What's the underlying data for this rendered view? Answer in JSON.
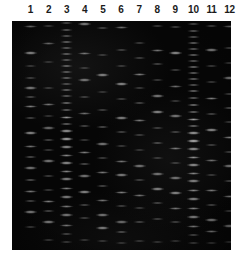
{
  "figure": {
    "kind": "agarose-gel-electrophoresis-photograph",
    "background_color": "#ffffff",
    "gel_color": "#050505",
    "band_color": "#e8e8e8",
    "lane_count": 12
  },
  "lane_labels": [
    "1",
    "2",
    "3",
    "4",
    "5",
    "6",
    "7",
    "8",
    "9",
    "10",
    "11",
    "12"
  ],
  "gel": {
    "left": 12,
    "top": 21,
    "width": 219,
    "height": 229,
    "lane_first_center": 18.5,
    "lane_spacing": 18.1,
    "lane_band_width": 15
  },
  "lanes": [
    {
      "lane": 1,
      "bands": [
        {
          "y": 26,
          "intensity": 0.46,
          "h": 3.0
        },
        {
          "y": 53,
          "intensity": 0.62,
          "h": 3.4
        },
        {
          "y": 66,
          "intensity": 0.3,
          "h": 2.6
        },
        {
          "y": 78,
          "intensity": 0.34,
          "h": 2.6
        },
        {
          "y": 88,
          "intensity": 0.52,
          "h": 3.2
        },
        {
          "y": 97,
          "intensity": 0.38,
          "h": 2.8
        },
        {
          "y": 106,
          "intensity": 0.48,
          "h": 3.0
        },
        {
          "y": 118,
          "intensity": 0.36,
          "h": 2.6
        },
        {
          "y": 133,
          "intensity": 0.58,
          "h": 3.4
        },
        {
          "y": 146,
          "intensity": 0.44,
          "h": 3.0
        },
        {
          "y": 157,
          "intensity": 0.4,
          "h": 2.8
        },
        {
          "y": 168,
          "intensity": 0.5,
          "h": 3.2
        },
        {
          "y": 180,
          "intensity": 0.42,
          "h": 2.8
        },
        {
          "y": 191,
          "intensity": 0.46,
          "h": 3.0
        },
        {
          "y": 201,
          "intensity": 0.38,
          "h": 2.8
        },
        {
          "y": 212,
          "intensity": 0.56,
          "h": 3.4
        },
        {
          "y": 227,
          "intensity": 0.34,
          "h": 2.6
        }
      ]
    },
    {
      "lane": 2,
      "bands": [
        {
          "y": 26,
          "intensity": 0.34,
          "h": 2.8
        },
        {
          "y": 43,
          "intensity": 0.4,
          "h": 3.0
        },
        {
          "y": 62,
          "intensity": 0.26,
          "h": 2.4
        },
        {
          "y": 88,
          "intensity": 0.3,
          "h": 2.6
        },
        {
          "y": 104,
          "intensity": 0.44,
          "h": 3.0
        },
        {
          "y": 116,
          "intensity": 0.28,
          "h": 2.4
        },
        {
          "y": 128,
          "intensity": 0.46,
          "h": 3.2
        },
        {
          "y": 140,
          "intensity": 0.38,
          "h": 2.8
        },
        {
          "y": 150,
          "intensity": 0.3,
          "h": 2.6
        },
        {
          "y": 161,
          "intensity": 0.52,
          "h": 3.2
        },
        {
          "y": 176,
          "intensity": 0.34,
          "h": 2.6
        },
        {
          "y": 190,
          "intensity": 0.3,
          "h": 2.6
        },
        {
          "y": 201,
          "intensity": 0.48,
          "h": 3.0
        },
        {
          "y": 211,
          "intensity": 0.36,
          "h": 2.8
        },
        {
          "y": 222,
          "intensity": 0.54,
          "h": 3.4
        },
        {
          "y": 240,
          "intensity": 0.3,
          "h": 2.6
        }
      ]
    },
    {
      "lane": 3,
      "bands": [
        {
          "y": 23,
          "intensity": 0.4,
          "h": 2.6
        },
        {
          "y": 30,
          "intensity": 0.48,
          "h": 2.6
        },
        {
          "y": 36,
          "intensity": 0.44,
          "h": 2.4
        },
        {
          "y": 42,
          "intensity": 0.52,
          "h": 2.6
        },
        {
          "y": 48,
          "intensity": 0.46,
          "h": 2.4
        },
        {
          "y": 54,
          "intensity": 0.5,
          "h": 2.6
        },
        {
          "y": 60,
          "intensity": 0.44,
          "h": 2.4
        },
        {
          "y": 66,
          "intensity": 0.54,
          "h": 2.6
        },
        {
          "y": 72,
          "intensity": 0.48,
          "h": 2.4
        },
        {
          "y": 78,
          "intensity": 0.5,
          "h": 2.6
        },
        {
          "y": 84,
          "intensity": 0.42,
          "h": 2.4
        },
        {
          "y": 90,
          "intensity": 0.52,
          "h": 2.6
        },
        {
          "y": 96,
          "intensity": 0.46,
          "h": 2.6
        },
        {
          "y": 103,
          "intensity": 0.56,
          "h": 2.8
        },
        {
          "y": 110,
          "intensity": 0.5,
          "h": 2.6
        },
        {
          "y": 117,
          "intensity": 0.58,
          "h": 3.0
        },
        {
          "y": 124,
          "intensity": 0.52,
          "h": 2.8
        },
        {
          "y": 131,
          "intensity": 0.62,
          "h": 3.2
        },
        {
          "y": 139,
          "intensity": 0.7,
          "h": 3.6
        },
        {
          "y": 147,
          "intensity": 0.58,
          "h": 3.2
        },
        {
          "y": 155,
          "intensity": 0.52,
          "h": 3.0
        },
        {
          "y": 163,
          "intensity": 0.6,
          "h": 3.2
        },
        {
          "y": 171,
          "intensity": 0.5,
          "h": 3.0
        },
        {
          "y": 179,
          "intensity": 0.56,
          "h": 3.2
        },
        {
          "y": 188,
          "intensity": 0.48,
          "h": 3.0
        },
        {
          "y": 197,
          "intensity": 0.54,
          "h": 3.2
        },
        {
          "y": 206,
          "intensity": 0.46,
          "h": 3.0
        },
        {
          "y": 215,
          "intensity": 0.52,
          "h": 3.2
        },
        {
          "y": 225,
          "intensity": 0.44,
          "h": 3.0
        },
        {
          "y": 234,
          "intensity": 0.38,
          "h": 2.8
        },
        {
          "y": 242,
          "intensity": 0.3,
          "h": 2.6
        }
      ]
    },
    {
      "lane": 4,
      "bands": [
        {
          "y": 24,
          "intensity": 0.55,
          "h": 3.4
        },
        {
          "y": 53,
          "intensity": 0.44,
          "h": 3.0
        },
        {
          "y": 68,
          "intensity": 0.3,
          "h": 2.6
        },
        {
          "y": 80,
          "intensity": 0.5,
          "h": 3.2
        },
        {
          "y": 97,
          "intensity": 0.34,
          "h": 2.6
        },
        {
          "y": 113,
          "intensity": 0.42,
          "h": 3.0
        },
        {
          "y": 126,
          "intensity": 0.38,
          "h": 2.8
        },
        {
          "y": 140,
          "intensity": 0.3,
          "h": 2.6
        },
        {
          "y": 152,
          "intensity": 0.48,
          "h": 3.0
        },
        {
          "y": 164,
          "intensity": 0.4,
          "h": 2.8
        },
        {
          "y": 176,
          "intensity": 0.52,
          "h": 3.2
        },
        {
          "y": 192,
          "intensity": 0.58,
          "h": 3.4
        },
        {
          "y": 205,
          "intensity": 0.36,
          "h": 2.8
        },
        {
          "y": 218,
          "intensity": 0.32,
          "h": 2.6
        },
        {
          "y": 240,
          "intensity": 0.28,
          "h": 2.4
        }
      ]
    },
    {
      "lane": 5,
      "bands": [
        {
          "y": 28,
          "intensity": 0.36,
          "h": 2.8
        },
        {
          "y": 55,
          "intensity": 0.3,
          "h": 2.6
        },
        {
          "y": 75,
          "intensity": 0.56,
          "h": 3.4
        },
        {
          "y": 92,
          "intensity": 0.28,
          "h": 2.4
        },
        {
          "y": 110,
          "intensity": 0.34,
          "h": 2.6
        },
        {
          "y": 127,
          "intensity": 0.4,
          "h": 2.8
        },
        {
          "y": 144,
          "intensity": 0.52,
          "h": 3.2
        },
        {
          "y": 158,
          "intensity": 0.32,
          "h": 2.6
        },
        {
          "y": 172,
          "intensity": 0.46,
          "h": 3.0
        },
        {
          "y": 186,
          "intensity": 0.38,
          "h": 2.8
        },
        {
          "y": 200,
          "intensity": 0.44,
          "h": 3.0
        },
        {
          "y": 215,
          "intensity": 0.5,
          "h": 3.2
        },
        {
          "y": 228,
          "intensity": 0.54,
          "h": 3.4
        },
        {
          "y": 241,
          "intensity": 0.28,
          "h": 2.4
        }
      ]
    },
    {
      "lane": 6,
      "bands": [
        {
          "y": 27,
          "intensity": 0.42,
          "h": 3.0
        },
        {
          "y": 50,
          "intensity": 0.34,
          "h": 2.6
        },
        {
          "y": 66,
          "intensity": 0.3,
          "h": 2.6
        },
        {
          "y": 84,
          "intensity": 0.58,
          "h": 3.4
        },
        {
          "y": 99,
          "intensity": 0.32,
          "h": 2.6
        },
        {
          "y": 118,
          "intensity": 0.56,
          "h": 3.4
        },
        {
          "y": 132,
          "intensity": 0.36,
          "h": 2.8
        },
        {
          "y": 146,
          "intensity": 0.3,
          "h": 2.6
        },
        {
          "y": 161,
          "intensity": 0.44,
          "h": 3.0
        },
        {
          "y": 175,
          "intensity": 0.54,
          "h": 3.4
        },
        {
          "y": 192,
          "intensity": 0.48,
          "h": 3.0
        },
        {
          "y": 206,
          "intensity": 0.34,
          "h": 2.8
        },
        {
          "y": 222,
          "intensity": 0.46,
          "h": 3.2
        },
        {
          "y": 232,
          "intensity": 0.4,
          "h": 2.8
        },
        {
          "y": 243,
          "intensity": 0.26,
          "h": 2.4
        }
      ]
    },
    {
      "lane": 7,
      "bands": [
        {
          "y": 43,
          "intensity": 0.3,
          "h": 2.6
        },
        {
          "y": 58,
          "intensity": 0.34,
          "h": 2.8
        },
        {
          "y": 74,
          "intensity": 0.48,
          "h": 3.0
        },
        {
          "y": 88,
          "intensity": 0.3,
          "h": 2.6
        },
        {
          "y": 103,
          "intensity": 0.38,
          "h": 2.8
        },
        {
          "y": 120,
          "intensity": 0.46,
          "h": 3.0
        },
        {
          "y": 135,
          "intensity": 0.32,
          "h": 2.6
        },
        {
          "y": 150,
          "intensity": 0.28,
          "h": 2.4
        },
        {
          "y": 166,
          "intensity": 0.5,
          "h": 3.2
        },
        {
          "y": 180,
          "intensity": 0.34,
          "h": 2.8
        },
        {
          "y": 195,
          "intensity": 0.44,
          "h": 3.0
        },
        {
          "y": 208,
          "intensity": 0.3,
          "h": 2.6
        },
        {
          "y": 222,
          "intensity": 0.36,
          "h": 2.8
        },
        {
          "y": 241,
          "intensity": 0.26,
          "h": 2.4
        }
      ]
    },
    {
      "lane": 8,
      "bands": [
        {
          "y": 26,
          "intensity": 0.32,
          "h": 2.6
        },
        {
          "y": 50,
          "intensity": 0.44,
          "h": 3.0
        },
        {
          "y": 64,
          "intensity": 0.36,
          "h": 2.8
        },
        {
          "y": 80,
          "intensity": 0.3,
          "h": 2.6
        },
        {
          "y": 96,
          "intensity": 0.52,
          "h": 3.2
        },
        {
          "y": 112,
          "intensity": 0.58,
          "h": 3.4
        },
        {
          "y": 128,
          "intensity": 0.34,
          "h": 2.8
        },
        {
          "y": 143,
          "intensity": 0.4,
          "h": 2.8
        },
        {
          "y": 158,
          "intensity": 0.3,
          "h": 2.6
        },
        {
          "y": 174,
          "intensity": 0.5,
          "h": 3.2
        },
        {
          "y": 189,
          "intensity": 0.56,
          "h": 3.4
        },
        {
          "y": 203,
          "intensity": 0.36,
          "h": 2.8
        },
        {
          "y": 219,
          "intensity": 0.32,
          "h": 2.6
        },
        {
          "y": 242,
          "intensity": 0.26,
          "h": 2.4
        }
      ]
    },
    {
      "lane": 9,
      "bands": [
        {
          "y": 27,
          "intensity": 0.38,
          "h": 2.8
        },
        {
          "y": 53,
          "intensity": 0.6,
          "h": 3.4
        },
        {
          "y": 70,
          "intensity": 0.34,
          "h": 2.6
        },
        {
          "y": 86,
          "intensity": 0.42,
          "h": 3.0
        },
        {
          "y": 101,
          "intensity": 0.3,
          "h": 2.6
        },
        {
          "y": 116,
          "intensity": 0.52,
          "h": 3.2
        },
        {
          "y": 132,
          "intensity": 0.36,
          "h": 2.8
        },
        {
          "y": 148,
          "intensity": 0.46,
          "h": 3.0
        },
        {
          "y": 163,
          "intensity": 0.32,
          "h": 2.6
        },
        {
          "y": 178,
          "intensity": 0.5,
          "h": 3.2
        },
        {
          "y": 193,
          "intensity": 0.58,
          "h": 3.4
        },
        {
          "y": 208,
          "intensity": 0.44,
          "h": 3.0
        },
        {
          "y": 222,
          "intensity": 0.34,
          "h": 2.8
        },
        {
          "y": 241,
          "intensity": 0.26,
          "h": 2.4
        }
      ]
    },
    {
      "lane": 10,
      "bands": [
        {
          "y": 24,
          "intensity": 0.42,
          "h": 2.6
        },
        {
          "y": 31,
          "intensity": 0.5,
          "h": 2.6
        },
        {
          "y": 37,
          "intensity": 0.46,
          "h": 2.4
        },
        {
          "y": 43,
          "intensity": 0.54,
          "h": 2.6
        },
        {
          "y": 49,
          "intensity": 0.48,
          "h": 2.4
        },
        {
          "y": 55,
          "intensity": 0.52,
          "h": 2.6
        },
        {
          "y": 61,
          "intensity": 0.46,
          "h": 2.4
        },
        {
          "y": 67,
          "intensity": 0.56,
          "h": 2.6
        },
        {
          "y": 73,
          "intensity": 0.5,
          "h": 2.4
        },
        {
          "y": 79,
          "intensity": 0.52,
          "h": 2.6
        },
        {
          "y": 85,
          "intensity": 0.44,
          "h": 2.4
        },
        {
          "y": 91,
          "intensity": 0.54,
          "h": 2.6
        },
        {
          "y": 98,
          "intensity": 0.48,
          "h": 2.6
        },
        {
          "y": 105,
          "intensity": 0.58,
          "h": 2.8
        },
        {
          "y": 112,
          "intensity": 0.52,
          "h": 2.6
        },
        {
          "y": 119,
          "intensity": 0.6,
          "h": 3.0
        },
        {
          "y": 126,
          "intensity": 0.54,
          "h": 2.8
        },
        {
          "y": 133,
          "intensity": 0.64,
          "h": 3.2
        },
        {
          "y": 141,
          "intensity": 0.72,
          "h": 3.6
        },
        {
          "y": 149,
          "intensity": 0.6,
          "h": 3.2
        },
        {
          "y": 157,
          "intensity": 0.54,
          "h": 3.0
        },
        {
          "y": 165,
          "intensity": 0.6,
          "h": 3.2
        },
        {
          "y": 173,
          "intensity": 0.5,
          "h": 3.0
        },
        {
          "y": 181,
          "intensity": 0.56,
          "h": 3.2
        },
        {
          "y": 190,
          "intensity": 0.5,
          "h": 3.0
        },
        {
          "y": 199,
          "intensity": 0.56,
          "h": 3.2
        },
        {
          "y": 208,
          "intensity": 0.48,
          "h": 3.0
        },
        {
          "y": 217,
          "intensity": 0.54,
          "h": 3.2
        },
        {
          "y": 226,
          "intensity": 0.46,
          "h": 3.0
        },
        {
          "y": 235,
          "intensity": 0.38,
          "h": 2.8
        },
        {
          "y": 243,
          "intensity": 0.3,
          "h": 2.6
        }
      ]
    },
    {
      "lane": 11,
      "bands": [
        {
          "y": 26,
          "intensity": 0.4,
          "h": 2.8
        },
        {
          "y": 50,
          "intensity": 0.56,
          "h": 3.4
        },
        {
          "y": 66,
          "intensity": 0.32,
          "h": 2.6
        },
        {
          "y": 82,
          "intensity": 0.3,
          "h": 2.6
        },
        {
          "y": 98,
          "intensity": 0.48,
          "h": 3.0
        },
        {
          "y": 114,
          "intensity": 0.36,
          "h": 2.8
        },
        {
          "y": 130,
          "intensity": 0.58,
          "h": 3.4
        },
        {
          "y": 145,
          "intensity": 0.34,
          "h": 2.6
        },
        {
          "y": 160,
          "intensity": 0.42,
          "h": 3.0
        },
        {
          "y": 175,
          "intensity": 0.3,
          "h": 2.6
        },
        {
          "y": 190,
          "intensity": 0.46,
          "h": 3.0
        },
        {
          "y": 205,
          "intensity": 0.36,
          "h": 2.8
        },
        {
          "y": 220,
          "intensity": 0.52,
          "h": 3.4
        },
        {
          "y": 231,
          "intensity": 0.44,
          "h": 3.0
        },
        {
          "y": 243,
          "intensity": 0.28,
          "h": 2.4
        }
      ]
    },
    {
      "lane": 12,
      "bands": [
        {
          "y": 26,
          "intensity": 0.44,
          "h": 3.0
        },
        {
          "y": 48,
          "intensity": 0.38,
          "h": 2.8
        },
        {
          "y": 63,
          "intensity": 0.3,
          "h": 2.6
        },
        {
          "y": 78,
          "intensity": 0.52,
          "h": 3.2
        },
        {
          "y": 94,
          "intensity": 0.34,
          "h": 2.8
        },
        {
          "y": 108,
          "intensity": 0.4,
          "h": 2.8
        },
        {
          "y": 122,
          "intensity": 0.3,
          "h": 2.6
        },
        {
          "y": 137,
          "intensity": 0.48,
          "h": 3.0
        },
        {
          "y": 152,
          "intensity": 0.34,
          "h": 2.8
        },
        {
          "y": 166,
          "intensity": 0.5,
          "h": 3.2
        },
        {
          "y": 181,
          "intensity": 0.36,
          "h": 2.8
        },
        {
          "y": 196,
          "intensity": 0.44,
          "h": 3.0
        },
        {
          "y": 211,
          "intensity": 0.3,
          "h": 2.6
        },
        {
          "y": 226,
          "intensity": 0.48,
          "h": 3.2
        },
        {
          "y": 242,
          "intensity": 0.26,
          "h": 2.4
        }
      ]
    }
  ]
}
